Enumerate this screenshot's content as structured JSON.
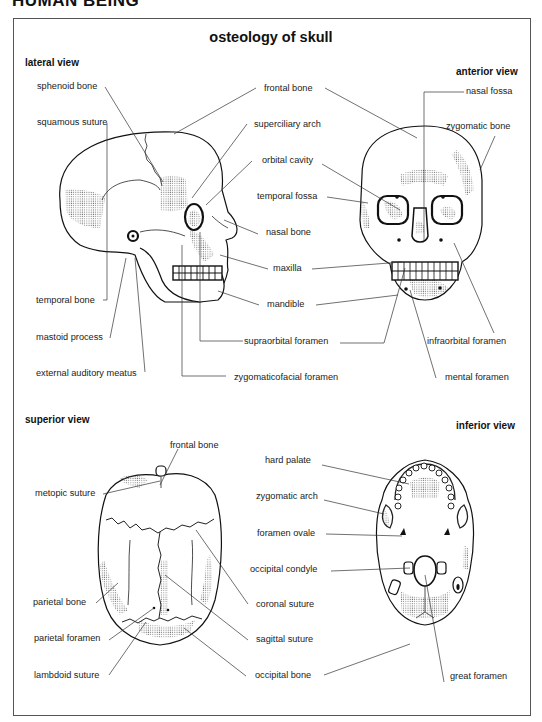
{
  "page_header": "HUMAN BEING",
  "title": "osteology of skull",
  "views": {
    "lateral": {
      "heading": "lateral view",
      "labels": [
        "sphenoid bone",
        "squamous suture",
        "temporal bone",
        "mastoid process",
        "external auditory meatus"
      ]
    },
    "center_top": {
      "labels": [
        "frontal bone",
        "superciliary arch",
        "orbital cavity",
        "temporal fossa",
        "nasal bone",
        "maxilla",
        "mandible",
        "supraorbital foramen",
        "zygomaticofacial foramen"
      ]
    },
    "anterior": {
      "heading": "anterior view",
      "labels": [
        "nasal fossa",
        "zygomatic bone",
        "infraorbital foramen",
        "mental foramen"
      ]
    },
    "superior": {
      "heading": "superior view",
      "labels": [
        "frontal bone",
        "metopic suture",
        "parietal bone",
        "parietal foramen",
        "lambdoid suture"
      ]
    },
    "center_bottom": {
      "labels": [
        "hard palate",
        "zygomatic arch",
        "foramen ovale",
        "occipital condyle",
        "coronal suture",
        "sagittal suture",
        "occipital bone"
      ]
    },
    "inferior": {
      "heading": "inferior view",
      "labels": [
        "great foramen"
      ]
    }
  }
}
